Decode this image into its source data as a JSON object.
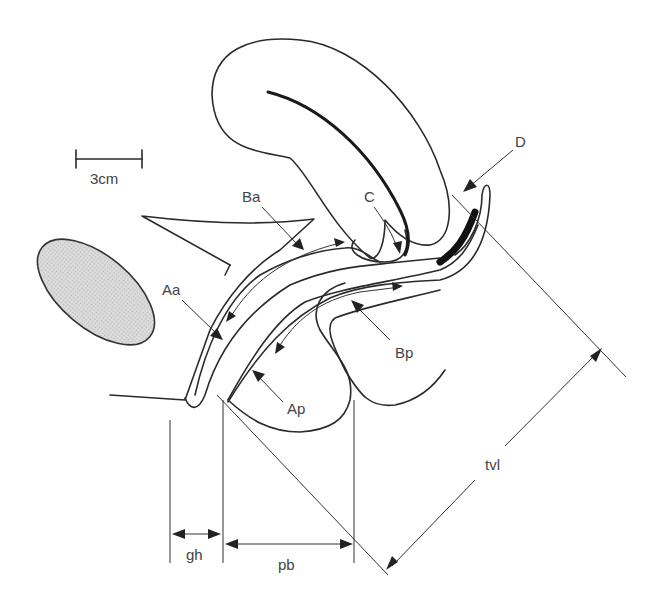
{
  "figure": {
    "scale_bar": {
      "label": "3cm"
    },
    "labels": {
      "Aa": "Aa",
      "Ba": "Ba",
      "C": "C",
      "D": "D",
      "Ap": "Ap",
      "Bp": "Bp",
      "gh": "gh",
      "pb": "pb",
      "tvl": "tvl"
    },
    "colors": {
      "line": "#2a2a2a",
      "pubic_bone_fill": "#d4d4d4",
      "background": "#ffffff",
      "label": "#444444"
    }
  }
}
